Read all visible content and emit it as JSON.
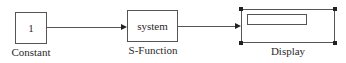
{
  "blocks": {
    "constant": {
      "value": "1",
      "label": "Constant"
    },
    "sfunction": {
      "value": "system",
      "label": "S-Function"
    },
    "display": {
      "label": "Display",
      "selected": true
    }
  },
  "connections": [
    {
      "from": "Constant",
      "to": "S-Function"
    },
    {
      "from": "S-Function",
      "to": "Display"
    }
  ]
}
